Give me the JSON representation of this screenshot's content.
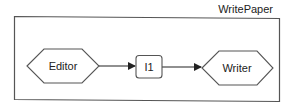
{
  "diagram": {
    "container": {
      "label": "WritePaper",
      "stroke_color": "#555555"
    },
    "nodes": [
      {
        "id": "editor",
        "label": "Editor",
        "shape": "hexagon"
      },
      {
        "id": "i1",
        "label": "I1",
        "shape": "rounded-rectangle"
      },
      {
        "id": "writer",
        "label": "Writer",
        "shape": "hexagon"
      }
    ],
    "edges": [
      {
        "from": "editor",
        "to": "i1",
        "arrow": "filled-triangle"
      },
      {
        "from": "i1",
        "to": "writer",
        "arrow": "filled-triangle"
      }
    ],
    "colors": {
      "line": "#333333",
      "node_stroke": "#555555",
      "node_fill": "#ffffff",
      "text": "#222222"
    }
  }
}
